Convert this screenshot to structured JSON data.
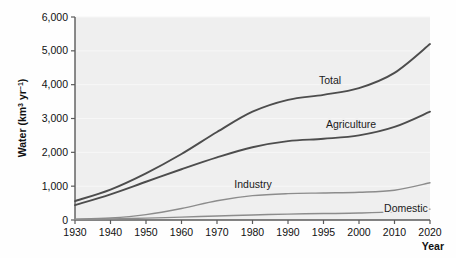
{
  "chart_data": {
    "type": "line",
    "title": "",
    "xlabel": "Year",
    "ylabel": "Water (km3 yr-1)",
    "ylabel_parts": {
      "prefix": "Water (km",
      "sup1": "3",
      "mid": " yr",
      "sup2": "−1",
      "suffix": ")"
    },
    "x": [
      1930,
      1940,
      1950,
      1960,
      1970,
      1980,
      1990,
      1995,
      2000,
      2010,
      2020
    ],
    "xtick_labels": [
      "1930",
      "1940",
      "1950",
      "1960",
      "1970",
      "1980",
      "1990",
      "1995",
      "2000",
      "2010",
      "2020"
    ],
    "ytick_labels": [
      "0",
      "1,000",
      "2,000",
      "3,000",
      "4,000",
      "5,000",
      "6,000"
    ],
    "yticks": [
      0,
      1000,
      2000,
      3000,
      4000,
      5000,
      6000
    ],
    "ylim": [
      0,
      6000
    ],
    "xlim": [
      1930,
      2020
    ],
    "grid": "horizontal",
    "legend": "inline-labels",
    "series": [
      {
        "name": "Total",
        "label": "Total",
        "color": "#4d4d4d",
        "width": 1.9,
        "values": [
          560,
          900,
          1380,
          1950,
          2600,
          3200,
          3550,
          3700,
          3900,
          4350,
          5200
        ]
      },
      {
        "name": "Agriculture",
        "label": "Agriculture",
        "color": "#4d4d4d",
        "width": 1.9,
        "values": [
          440,
          760,
          1130,
          1500,
          1850,
          2150,
          2330,
          2400,
          2500,
          2750,
          3200
        ]
      },
      {
        "name": "Industry",
        "label": "Industry",
        "color": "#8c8c8c",
        "width": 1.4,
        "values": [
          25,
          60,
          160,
          340,
          570,
          720,
          780,
          800,
          820,
          880,
          1100
        ]
      },
      {
        "name": "Domestic",
        "label": "Domestic",
        "color": "#8c8c8c",
        "width": 1.4,
        "values": [
          15,
          30,
          55,
          85,
          120,
          150,
          175,
          190,
          205,
          240,
          320
        ]
      }
    ],
    "series_label_positions": [
      {
        "name": "Total",
        "x": 330,
        "y": 84
      },
      {
        "name": "Agriculture",
        "x": 351,
        "y": 128
      },
      {
        "name": "Industry",
        "x": 253,
        "y": 188
      },
      {
        "name": "Domestic",
        "x": 406,
        "y": 212
      }
    ],
    "axis_title_position": {
      "x": 444,
      "y": 250
    }
  }
}
